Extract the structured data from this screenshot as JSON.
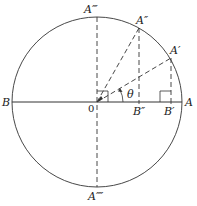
{
  "diagram": {
    "colors": {
      "stroke": "#333333",
      "background": "#ffffff"
    },
    "circle": {
      "cx": 97,
      "cy": 102,
      "r": 85
    },
    "labels": {
      "A": "A",
      "A_prime": "A′",
      "A_double": "A″",
      "A_triple": "A‴",
      "A_quad": "A⁗",
      "B": "B",
      "B_prime": "B′",
      "B_double": "B″",
      "origin": "0",
      "theta": "θ"
    }
  }
}
